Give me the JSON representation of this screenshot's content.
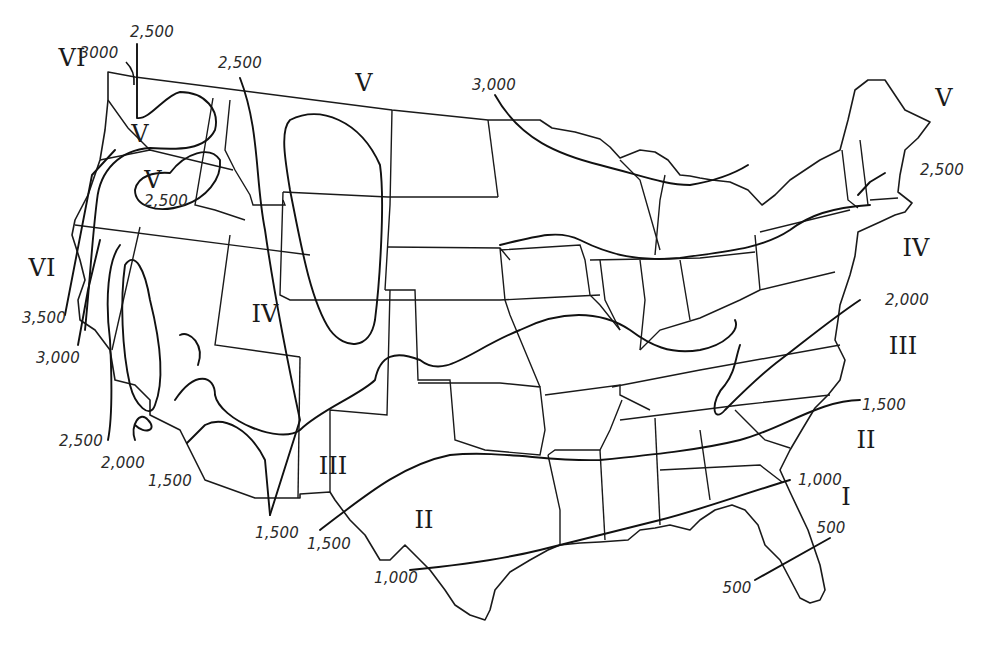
{
  "map": {
    "subject": "United States isoline map with Roman-numeral zones",
    "zones": [
      {
        "id": "vi-nw",
        "label": "VI",
        "x": 72,
        "y": 58
      },
      {
        "id": "v-wa",
        "label": "V",
        "x": 140,
        "y": 134
      },
      {
        "id": "v-or",
        "label": "V",
        "x": 153,
        "y": 180
      },
      {
        "id": "v-north",
        "label": "V",
        "x": 364,
        "y": 83
      },
      {
        "id": "v-maine",
        "label": "V",
        "x": 944,
        "y": 98
      },
      {
        "id": "vi-ca",
        "label": "VI",
        "x": 42,
        "y": 268
      },
      {
        "id": "iv-west",
        "label": "IV",
        "x": 265,
        "y": 314
      },
      {
        "id": "iv-east",
        "label": "IV",
        "x": 916,
        "y": 248
      },
      {
        "id": "iii-east",
        "label": "III",
        "x": 903,
        "y": 346
      },
      {
        "id": "iii-sw",
        "label": "III",
        "x": 333,
        "y": 466
      },
      {
        "id": "ii-east",
        "label": "II",
        "x": 866,
        "y": 440
      },
      {
        "id": "ii-tx",
        "label": "II",
        "x": 424,
        "y": 520
      },
      {
        "id": "i-fl",
        "label": "I",
        "x": 846,
        "y": 497
      }
    ],
    "isoline_labels": [
      {
        "id": "l-2500-wa",
        "text": "2,500",
        "x": 152,
        "y": 32
      },
      {
        "id": "l-3000-wa",
        "text": "3000",
        "x": 99,
        "y": 53
      },
      {
        "id": "l-2500-mt",
        "text": "2,500",
        "x": 240,
        "y": 63
      },
      {
        "id": "l-2500-or",
        "text": "2,500",
        "x": 166,
        "y": 201
      },
      {
        "id": "l-3000-mn",
        "text": "3,000",
        "x": 494,
        "y": 85
      },
      {
        "id": "l-2500-ne",
        "text": "2,500",
        "x": 942,
        "y": 170
      },
      {
        "id": "l-2000-ne",
        "text": "2,000",
        "x": 907,
        "y": 300
      },
      {
        "id": "l-3500-ca",
        "text": "3,500",
        "x": 44,
        "y": 318
      },
      {
        "id": "l-3000-ca",
        "text": "3,000",
        "x": 58,
        "y": 358
      },
      {
        "id": "l-2500-ca",
        "text": "2,500",
        "x": 81,
        "y": 441
      },
      {
        "id": "l-2000-ca",
        "text": "2,000",
        "x": 123,
        "y": 463
      },
      {
        "id": "l-1500-ca",
        "text": "1,500",
        "x": 170,
        "y": 481
      },
      {
        "id": "l-1500-se",
        "text": "1,500",
        "x": 884,
        "y": 405
      },
      {
        "id": "l-1500-az",
        "text": "1,500",
        "x": 277,
        "y": 533
      },
      {
        "id": "l-1500-nm",
        "text": "1,500",
        "x": 329,
        "y": 544
      },
      {
        "id": "l-1000-se",
        "text": "1,000",
        "x": 820,
        "y": 480
      },
      {
        "id": "l-500-e",
        "text": "500",
        "x": 831,
        "y": 528
      },
      {
        "id": "l-1000-tx",
        "text": "1,000",
        "x": 396,
        "y": 578
      },
      {
        "id": "l-500-w",
        "text": "500",
        "x": 737,
        "y": 588
      }
    ]
  }
}
